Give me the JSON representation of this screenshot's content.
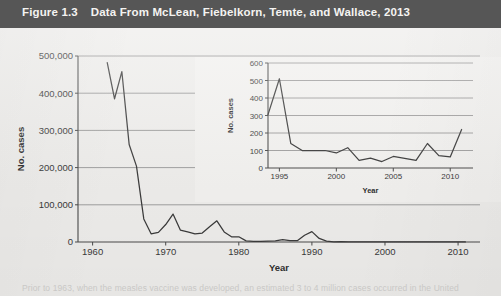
{
  "figure": {
    "number": "Figure 1.3",
    "title": "Data From McLean, Fiebelkorn, Temte, and Wallace, 2013"
  },
  "caption": {
    "text": "Prior to 1963, when the measles vaccine was developed, an estimated 3 to 4 million cases occurred in the United"
  },
  "chart_data": [
    {
      "id": "main",
      "type": "line",
      "title": "",
      "xlabel": "Year",
      "ylabel": "No. cases",
      "xlim": [
        1958,
        2013
      ],
      "ylim": [
        0,
        500000
      ],
      "xticks": [
        1960,
        1970,
        1980,
        1990,
        2000,
        2010
      ],
      "yticks": [
        0,
        100000,
        200000,
        300000,
        400000,
        500000
      ],
      "ytick_labels": [
        "0",
        "100,000",
        "200,000",
        "300,000",
        "400,000",
        "500,000"
      ],
      "grid": true,
      "legend": "none",
      "series": [
        {
          "name": "Measles cases, United States",
          "x": [
            1962,
            1963,
            1964,
            1965,
            1966,
            1967,
            1968,
            1969,
            1970,
            1971,
            1972,
            1973,
            1974,
            1975,
            1976,
            1977,
            1978,
            1979,
            1980,
            1981,
            1982,
            1983,
            1984,
            1985,
            1986,
            1987,
            1988,
            1989,
            1990,
            1991,
            1992,
            1993,
            1994,
            1995,
            1996,
            1997,
            1998,
            1999,
            2000,
            2001,
            2002,
            2003,
            2004,
            2005,
            2006,
            2007,
            2008,
            2009,
            2010,
            2011
          ],
          "values": [
            482000,
            385000,
            458000,
            262000,
            204000,
            62000,
            22000,
            26000,
            47000,
            75000,
            32000,
            27000,
            22000,
            24000,
            41000,
            57000,
            27000,
            14000,
            14000,
            3100,
            1700,
            1500,
            2600,
            2800,
            6300,
            3700,
            3400,
            18200,
            27800,
            9600,
            2200,
            310,
            960,
            310,
            510,
            140,
            100,
            100,
            86,
            116,
            44,
            56,
            37,
            66,
            55,
            43,
            140,
            71,
            63,
            220
          ]
        }
      ]
    },
    {
      "id": "inset",
      "type": "line",
      "title": "",
      "xlabel": "Year",
      "ylabel": "No. cases",
      "xlim": [
        1994,
        2012
      ],
      "ylim": [
        0,
        600
      ],
      "xticks": [
        1995,
        2000,
        2005,
        2010
      ],
      "yticks": [
        0,
        100,
        200,
        300,
        400,
        500,
        600
      ],
      "ytick_labels": [
        "0",
        "100",
        "200",
        "300",
        "400",
        "500",
        "600"
      ],
      "grid": true,
      "legend": "none",
      "series": [
        {
          "name": "Measles cases, United States (recent years)",
          "x": [
            1994,
            1995,
            1996,
            1997,
            1998,
            1999,
            2000,
            2001,
            2002,
            2003,
            2004,
            2005,
            2006,
            2007,
            2008,
            2009,
            2010,
            2011
          ],
          "values": [
            305,
            510,
            140,
            100,
            100,
            100,
            86,
            116,
            44,
            56,
            37,
            66,
            55,
            43,
            140,
            71,
            63,
            220
          ]
        }
      ]
    }
  ]
}
